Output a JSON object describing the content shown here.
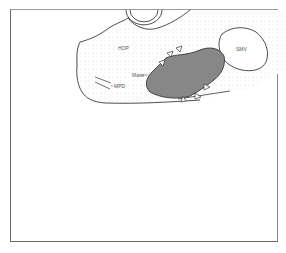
{
  "figure": {
    "labels": {
      "hop": "HOP",
      "smv": "SMV",
      "mass": "Mass",
      "mpd": "MPD"
    },
    "colors": {
      "outline": "#3a3a3a",
      "parenchyma_stipple": "#d8d8d8",
      "mass_fill": "#8c8c8c",
      "mass_hatch": "#7a7a7a",
      "background": "#ffffff"
    },
    "arrowheads_count": 6
  }
}
